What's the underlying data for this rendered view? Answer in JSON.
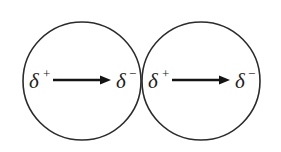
{
  "figure": {
    "background_color": "#ffffff",
    "stroke_color": "#2b2b2b",
    "arrow_color": "#141414",
    "text_color": "#1c1c1c",
    "alt_text": "Two touching circles, each with a horizontal arrow pointing from delta plus on the left to delta minus on the right"
  },
  "circles": [
    {
      "name": "left-circle",
      "center_x": 82,
      "center_y": 81,
      "radius": 59
    },
    {
      "name": "right-circle",
      "center_x": 201,
      "center_y": 81,
      "radius": 59
    }
  ],
  "dipoles": [
    {
      "name": "left-dipole",
      "positive_symbol": "δ",
      "positive_sign": "+",
      "negative_symbol": "δ",
      "negative_sign": "−",
      "arrow_start_x": 53,
      "arrow_end_x": 111,
      "arrow_y": 80,
      "positive_label_x": 29,
      "negative_label_x": 116,
      "label_y": 88
    },
    {
      "name": "right-dipole",
      "positive_symbol": "δ",
      "positive_sign": "+",
      "negative_symbol": "δ",
      "negative_sign": "−",
      "arrow_start_x": 172,
      "arrow_end_x": 230,
      "arrow_y": 80,
      "positive_label_x": 148,
      "negative_label_x": 235,
      "label_y": 88
    }
  ]
}
